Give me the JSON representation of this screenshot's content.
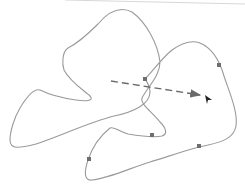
{
  "diagram": {
    "background": "#ffffff",
    "top_border": {
      "x1": 65,
      "y1": 0,
      "x2": 245,
      "y2": 4,
      "color": "#d8d8d8"
    },
    "curve": {
      "stroke": "#9a9a9a",
      "stroke_width": 1.1,
      "path": "M145,79 C152,72 162,58 172,50 C182,43 192,40 200,43 C212,48 220,62 224,76 C230,94 238,112 236,126 C234,138 222,142 208,145 C192,148 170,156 150,162 C130,168 110,178 92,180 C84,181 84,172 88,160 C92,148 100,136 110,128 C114,126 120,132 128,134 C140,136 154,138 162,136 C168,134 166,128 160,122 C152,112 140,104 142,98 C148,86 160,76 160,62 C158,44 146,22 132,12 C120,6 108,12 98,24 C88,34 76,44 68,48 C62,52 62,64 64,70 C70,82 86,92 90,96 C94,100 88,102 76,100 C62,98 48,94 40,90 C34,88 26,98 20,108 C14,118 10,132 10,140 C10,150 20,148 36,144 C60,136 90,122 114,116 C134,112 150,104 150,92 C150,86 147,82 145,79 Z",
      "markers": [
        {
          "x": 145,
          "y": 79
        },
        {
          "x": 219,
          "y": 65
        },
        {
          "x": 152,
          "y": 135
        },
        {
          "x": 199,
          "y": 146
        },
        {
          "x": 89,
          "y": 159
        }
      ],
      "marker_color": "#6e6e6e",
      "marker_size": 4
    },
    "dashed_arrow": {
      "x1": 111,
      "y1": 81,
      "x2": 200,
      "y2": 95,
      "color": "#6a6a6a",
      "dash": "7 4",
      "stroke_width": 1.4
    },
    "cursor": {
      "x": 205,
      "y": 95,
      "color": "#222222"
    }
  }
}
